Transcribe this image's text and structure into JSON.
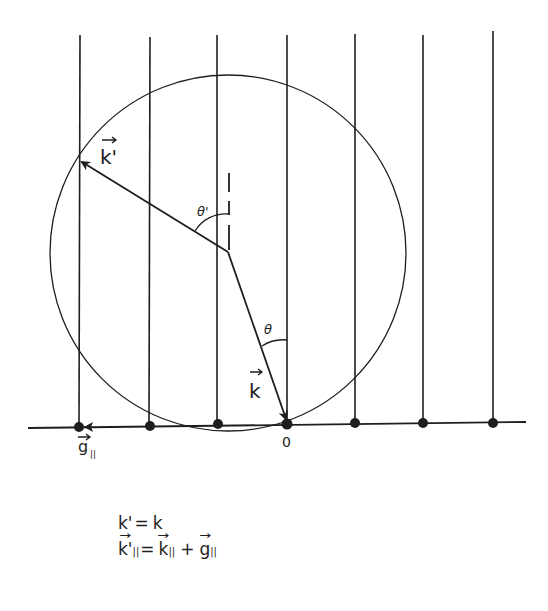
{
  "diagram": {
    "title": "",
    "colors": {
      "ink": "#1e1e1e",
      "background": "#ffffff"
    },
    "lattice_rods": {
      "x": [
        80,
        150,
        217,
        287,
        355,
        423,
        493
      ],
      "top_y": [
        35,
        37,
        35,
        35,
        34,
        35,
        31
      ],
      "baseline_y": 424
    },
    "baseline": {
      "x1": 28,
      "y1": 428,
      "x2": 526,
      "y2": 422
    },
    "ewald_circle": {
      "cx": 228,
      "cy": 253,
      "r": 178
    },
    "vectors": {
      "k": {
        "label": "k",
        "from": [
          228,
          252
        ],
        "to": [
          287,
          421
        ]
      },
      "k_prime": {
        "label": "k'",
        "from": [
          228,
          252
        ],
        "to": [
          80,
          160
        ]
      },
      "g_parallel": {
        "label": "g",
        "subscript": "||"
      }
    },
    "angles": {
      "theta": "θ",
      "theta_prime": "θ'"
    },
    "origin_label": "0",
    "equations": [
      {
        "lhs": "k'",
        "eq": "=",
        "rhs": "k"
      },
      {
        "lhs": "k'",
        "lhs_sub": "||",
        "eq": "=",
        "rhs1": "k",
        "rhs1_sub": "||",
        "op": "+",
        "rhs2": "g",
        "rhs2_sub": "||"
      }
    ]
  }
}
